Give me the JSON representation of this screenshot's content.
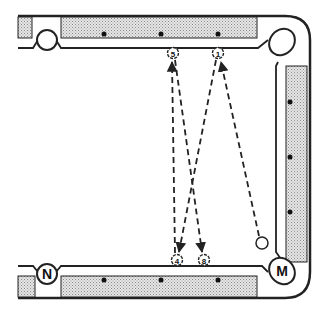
{
  "diagram": {
    "type": "pool-table-shot-diagram",
    "colors": {
      "rail_fill": "#d4d4d4",
      "line": "#222222",
      "background": "#ffffff"
    },
    "pockets": [
      {
        "id": "top-left",
        "label": ""
      },
      {
        "id": "top-right",
        "label": ""
      },
      {
        "id": "bottom-left",
        "label": "N"
      },
      {
        "id": "bottom-right",
        "label": "M"
      }
    ],
    "balls": [
      {
        "number": "5",
        "x": 173,
        "y": 53
      },
      {
        "number": "1",
        "x": 218,
        "y": 53
      },
      {
        "number": "4",
        "x": 177,
        "y": 260
      },
      {
        "number": "8",
        "x": 204,
        "y": 260
      }
    ],
    "cue_ball": {
      "x": 262,
      "y": 243
    },
    "paths": [
      {
        "from": "cue-ball",
        "to": "ball-1"
      },
      {
        "from": "ball-1",
        "to": "ball-4"
      },
      {
        "from": "ball-4",
        "to": "ball-5"
      },
      {
        "from": "ball-5",
        "to": "ball-8"
      }
    ]
  }
}
